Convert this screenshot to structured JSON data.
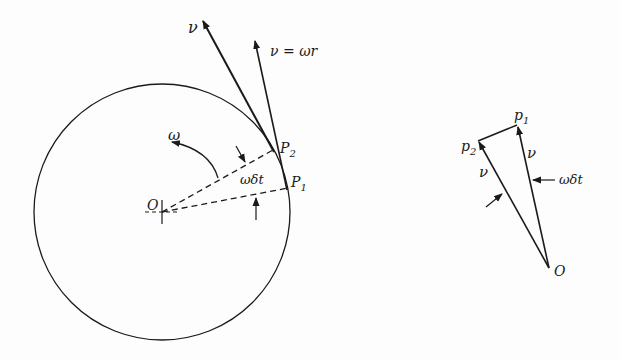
{
  "left_figure": {
    "labels": {
      "v_top": "ν",
      "v_eq": "ν = ωr",
      "omega": "ω",
      "p2": "P",
      "p2_sub": "2",
      "p1": "P",
      "p1_sub": "1",
      "omega_dt": "ωδt",
      "origin": "O"
    }
  },
  "right_figure": {
    "labels": {
      "p1": "p",
      "p1_sub": "1",
      "p2": "p",
      "p2_sub": "2",
      "v_right": "ν",
      "v_left": "ν",
      "omega_dt": "ωδt",
      "origin": "O"
    }
  },
  "colors": {
    "ink": "#1a1a1a",
    "background": "#fdfdfd"
  }
}
